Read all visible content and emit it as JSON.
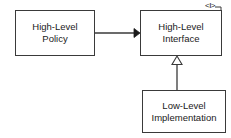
{
  "diagram": {
    "type": "uml-class-diagram",
    "background_color": "#ffffff",
    "line_color": "#3a3a3a",
    "text_color": "#1a1a1a",
    "nodes": [
      {
        "id": "high-level-policy",
        "line1": "High-Level",
        "line2": "Policy"
      },
      {
        "id": "high-level-interface",
        "line1": "High-Level",
        "line2": "Interface",
        "stereotype_marker": "<I>"
      },
      {
        "id": "low-level-implementation",
        "line1": "Low-Level",
        "line2": "Implementation"
      }
    ],
    "edges": [
      {
        "id": "policy-uses-interface",
        "from": "high-level-policy",
        "to": "high-level-interface",
        "arrow": "solid-filled-arrowhead",
        "style": "solid"
      },
      {
        "id": "implementation-realizes-interface",
        "from": "low-level-implementation",
        "to": "high-level-interface",
        "arrow": "hollow-triangle-arrowhead",
        "style": "solid"
      }
    ]
  }
}
